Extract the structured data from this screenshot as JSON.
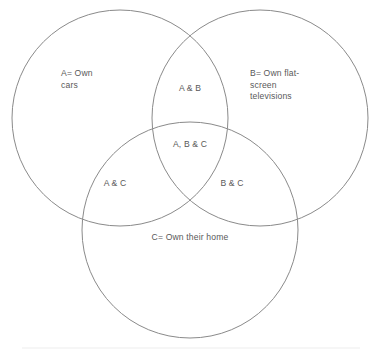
{
  "figure": {
    "background_color": "#ffffff",
    "stroke_color": "#8a8a8a",
    "text_color": "#595959",
    "rule_color": "#ededed"
  },
  "sets": {
    "a": {
      "key": "A",
      "label": "A= Own\ncars",
      "center_x": 120,
      "center_y": 118,
      "radius": 108
    },
    "b": {
      "key": "B",
      "label": "B= Own flat-\nscreen\ntelevisions",
      "center_x": 260,
      "center_y": 118,
      "radius": 108
    },
    "c": {
      "key": "C",
      "label": "C= Own their home",
      "center_x": 190,
      "center_y": 230,
      "radius": 108
    }
  },
  "regions": {
    "ab": "A & B",
    "ac": "A & C",
    "bc": "B & C",
    "abc": "A, B & C"
  },
  "footer_rule": {
    "x1": 22,
    "x2": 360,
    "y": 348
  },
  "chart_data": {
    "type": "diagram",
    "subtype": "venn3",
    "title": "",
    "sets": [
      {
        "key": "A",
        "label": "A= Own cars",
        "cx": 120,
        "cy": 118,
        "r": 108
      },
      {
        "key": "B",
        "label": "B= Own flat-screen televisions",
        "cx": 260,
        "cy": 118,
        "r": 108
      },
      {
        "key": "C",
        "label": "C= Own their home",
        "cx": 190,
        "cy": 230,
        "r": 108
      }
    ],
    "regions": [
      {
        "key": "A",
        "label": "A= Own cars",
        "x": 75,
        "y": 78
      },
      {
        "key": "B",
        "label": "B= Own flat-screen televisions",
        "x": 285,
        "y": 84
      },
      {
        "key": "C",
        "label": "C= Own their home",
        "x": 190,
        "y": 238
      },
      {
        "key": "AB",
        "label": "A & B",
        "x": 190,
        "y": 89
      },
      {
        "key": "AC",
        "label": "A & C",
        "x": 115,
        "y": 184
      },
      {
        "key": "BC",
        "label": "B & C",
        "x": 232,
        "y": 184
      },
      {
        "key": "ABC",
        "label": "A, B & C",
        "x": 190,
        "y": 145
      }
    ],
    "values": [],
    "xlabel": "",
    "ylabel": "",
    "grid": false,
    "legend": "none"
  }
}
